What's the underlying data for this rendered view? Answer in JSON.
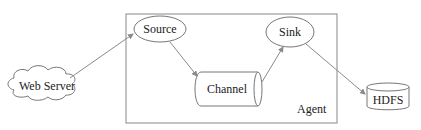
{
  "diagram": {
    "container": {
      "label": "Agent"
    },
    "nodes": {
      "web_server": {
        "label": "Web Server",
        "shape": "cloud"
      },
      "source": {
        "label": "Source",
        "shape": "ellipse"
      },
      "channel": {
        "label": "Channel",
        "shape": "horizontal-cylinder"
      },
      "sink": {
        "label": "Sink",
        "shape": "ellipse"
      },
      "hdfs": {
        "label": "HDFS",
        "shape": "vertical-cylinder"
      }
    },
    "edges": [
      {
        "from": "Web Server",
        "to": "Source"
      },
      {
        "from": "Source",
        "to": "Channel"
      },
      {
        "from": "Channel",
        "to": "Sink"
      },
      {
        "from": "Sink",
        "to": "HDFS"
      }
    ],
    "colors": {
      "stroke": "#777777",
      "arrow": "#8a8a8a",
      "text": "#222222",
      "background": "#ffffff"
    }
  }
}
